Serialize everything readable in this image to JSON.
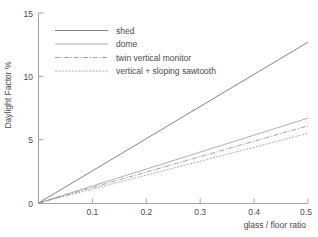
{
  "chart_data": {
    "type": "line",
    "title": "",
    "subtitle": "",
    "xlabel": "glass / floor ratio",
    "ylabel": "Daylight Factor %",
    "xlim": [
      0,
      0.5
    ],
    "ylim": [
      0,
      15
    ],
    "xticks": [
      0.1,
      0.2,
      0.3,
      0.4,
      0.5
    ],
    "xtick_labels": [
      "0.1",
      "0.2",
      "0.3",
      "0.4",
      "0.5"
    ],
    "yticks": [
      0,
      5,
      10,
      15
    ],
    "ytick_labels": [
      "0",
      "5",
      "10",
      "15"
    ],
    "grid": false,
    "legend_position": "upper left inside",
    "x": [
      0,
      0.5
    ],
    "series": [
      {
        "name": "shed",
        "values": [
          0,
          12.7
        ],
        "slope": 25.4,
        "style": "solid",
        "color": "#6e6e6e",
        "dash": "none"
      },
      {
        "name": "dome",
        "values": [
          0,
          6.7
        ],
        "slope": 13.4,
        "style": "solid",
        "color": "#9a9a9a",
        "dash": "none"
      },
      {
        "name": "twin vertical monitor",
        "values": [
          0,
          6.1
        ],
        "slope": 12.2,
        "style": "dash-dot",
        "color": "#8a8a8a",
        "dash": "5,1.6,1.2,1.6"
      },
      {
        "name": "vertical + sloping sawtooth",
        "values": [
          0,
          5.5
        ],
        "slope": 11.0,
        "style": "fine-dashed",
        "color": "#9a9a9a",
        "dash": "2.1,1.3"
      }
    ]
  },
  "legend": {
    "entries": [
      {
        "label": "shed"
      },
      {
        "label": "dome"
      },
      {
        "label": "twin vertical monitor"
      },
      {
        "label": "vertical + sloping sawtooth"
      }
    ]
  },
  "axes": {
    "x_title": "glass / floor ratio",
    "y_title": "Daylight Factor %"
  }
}
